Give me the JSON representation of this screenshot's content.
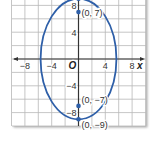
{
  "chart_data": {
    "type": "line",
    "title": "",
    "xlabel": "x",
    "ylabel": "",
    "origin_label": "O",
    "xlim": [
      -10,
      10
    ],
    "ylim": [
      -10,
      9
    ],
    "grid": true,
    "grid_step": 2,
    "x_ticks": [
      -8,
      -4,
      4,
      8
    ],
    "x_tick_labels": [
      "−8",
      "−4",
      "4",
      "8"
    ],
    "y_ticks": [
      8,
      4,
      -4,
      -8
    ],
    "y_tick_labels": [
      "8",
      "4",
      "−4",
      "−8"
    ],
    "series": [
      {
        "name": "ellipse",
        "shape": "ellipse",
        "center": [
          0,
          0
        ],
        "semi_major_y": 9,
        "semi_minor_x": 5.66,
        "color": "#2e5fa8"
      }
    ],
    "points": [
      {
        "x": 0,
        "y": 9,
        "label": ""
      },
      {
        "x": 0,
        "y": 7,
        "label": "(0, 7)"
      },
      {
        "x": 0,
        "y": -7,
        "label": "(0, −7)"
      },
      {
        "x": 0,
        "y": -9,
        "label": "(0, −9)"
      }
    ]
  },
  "colors": {
    "curve": "#2e5fa8",
    "grid": "#b8b8b8",
    "axis": "#333333",
    "point": "#2e5fa8"
  }
}
